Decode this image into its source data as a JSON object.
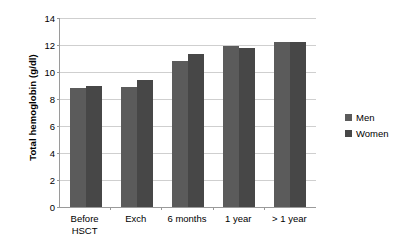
{
  "chart_data": {
    "type": "bar",
    "title": "",
    "xlabel": "",
    "ylabel": "Total hemoglobin (g/dl)",
    "ylim": [
      0,
      14
    ],
    "ytick_step": 2,
    "yticks": [
      14,
      12,
      10,
      8,
      6,
      4,
      2,
      0
    ],
    "grid": true,
    "legend_position": "right",
    "categories": [
      "Before\nHSCT",
      "Exch",
      "6 months",
      "1 year",
      "> 1 year"
    ],
    "series": [
      {
        "name": "Men",
        "color": "#5b5b5b",
        "values": [
          8.8,
          8.9,
          10.8,
          11.9,
          12.2
        ]
      },
      {
        "name": "Women",
        "color": "#474747",
        "values": [
          9.0,
          9.4,
          11.3,
          11.75,
          12.2
        ]
      }
    ]
  },
  "axis": {
    "y_title": "Total hemoglobin (g/dl)"
  }
}
